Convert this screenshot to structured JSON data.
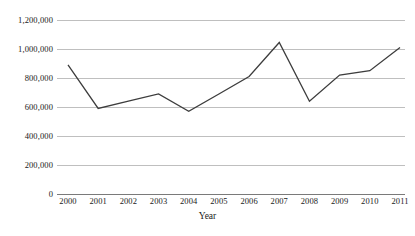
{
  "chart_data": {
    "type": "line",
    "title": "",
    "xlabel": "Year",
    "ylabel": "",
    "categories": [
      "2000",
      "2001",
      "2002",
      "2003",
      "2004",
      "2005",
      "2006",
      "2007",
      "2008",
      "2009",
      "2010",
      "2011"
    ],
    "values": [
      890000,
      590000,
      640000,
      690000,
      570000,
      690000,
      810000,
      1045000,
      640000,
      820000,
      850000,
      1010000
    ],
    "series": [
      {
        "name": "",
        "values": [
          890000,
          590000,
          640000,
          690000,
          570000,
          690000,
          810000,
          1045000,
          640000,
          820000,
          850000,
          1010000
        ]
      }
    ],
    "ylim": [
      0,
      1200000
    ],
    "ytick_values": [
      0,
      200000,
      400000,
      600000,
      800000,
      1000000,
      1200000
    ],
    "ytick_labels": [
      "0",
      "200,000",
      "400,000",
      "600,000",
      "800,000",
      "1,000,000",
      "1,200,000"
    ],
    "grid": true,
    "legend": false,
    "legend_position": "none",
    "line_color": "#3d3d3d",
    "grid_color": "#bfbfbf",
    "axis_color": "#7a7a7a"
  }
}
